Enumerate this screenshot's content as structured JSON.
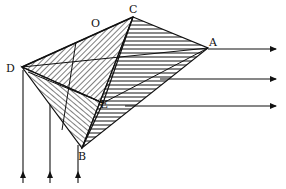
{
  "figure": {
    "type": "geometric-projection-diagram",
    "points": {
      "A": {
        "label": "A",
        "x": 208,
        "y": 48
      },
      "B": {
        "label": "B",
        "x": 82,
        "y": 148
      },
      "C": {
        "label": "C",
        "x": 133,
        "y": 17
      },
      "D": {
        "label": "D",
        "x": 22,
        "y": 67
      },
      "E": {
        "label": "E",
        "x": 103,
        "y": 103
      },
      "O": {
        "label": "O",
        "x": 96,
        "y": 26
      }
    },
    "horizontal_arrows": [
      {
        "y": 49,
        "x_start": 208,
        "x_end": 276
      },
      {
        "y": 79,
        "x_start": 160,
        "x_end": 276
      },
      {
        "y": 106,
        "x_start": 125,
        "x_end": 276
      }
    ],
    "vertical_arrows": [
      {
        "x": 23,
        "y_start": 70,
        "y_end": 183
      },
      {
        "x": 50,
        "y_start": 105,
        "y_end": 183
      },
      {
        "x": 78,
        "y_start": 145,
        "y_end": 183
      }
    ],
    "colors": {
      "ink": "#111111",
      "background": "#ffffff"
    }
  }
}
